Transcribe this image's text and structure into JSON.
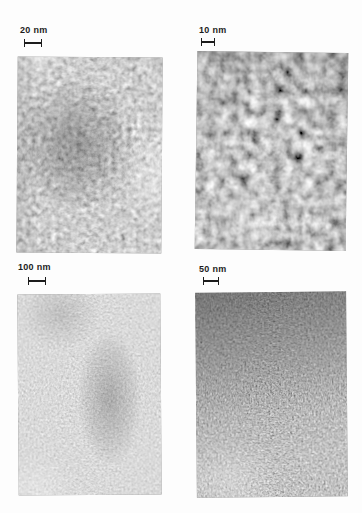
{
  "page": {
    "background_color": "#fdfdfd",
    "ink_color": "#1c1c1c"
  },
  "figure": {
    "type": "tem-micrograph-grid-2x2",
    "panels": [
      {
        "position": "top-left",
        "scale_label": "20 nm",
        "texture": "fine mottled worm-like grain, dark patch center-left, light strip on right",
        "avg_tone": "#9a9a9a"
      },
      {
        "position": "top-right",
        "scale_label": "10 nm",
        "texture": "coarse dark blobby mottle, slightly darker at top",
        "avg_tone": "#8c8c8c"
      },
      {
        "position": "bottom-left",
        "scale_label": "100 nm",
        "texture": "very fine light speckle with soft dark vertical smudge right of center",
        "avg_tone": "#b0b0b0"
      },
      {
        "position": "bottom-right",
        "scale_label": "50 nm",
        "texture": "very fine speckle, dark at top grading lighter toward bottom-left",
        "avg_tone": "#8a8a8a"
      }
    ]
  }
}
